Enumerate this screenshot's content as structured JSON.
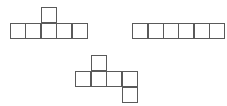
{
  "diagram": {
    "type": "cube-nets",
    "cell_size": 16,
    "line_color": "#5a5a5a",
    "background": "#ffffff",
    "nets": [
      {
        "id": "net-1",
        "description": "Row of five squares with one square above the third",
        "cells": [
          {
            "x": 41,
            "y": 7
          },
          {
            "x": 10,
            "y": 23
          },
          {
            "x": 25,
            "y": 23
          },
          {
            "x": 41,
            "y": 23
          },
          {
            "x": 56,
            "y": 23
          },
          {
            "x": 72,
            "y": 23
          }
        ]
      },
      {
        "id": "net-2",
        "description": "Row of six squares",
        "cells": [
          {
            "x": 132,
            "y": 23
          },
          {
            "x": 148,
            "y": 23
          },
          {
            "x": 163,
            "y": 23
          },
          {
            "x": 178,
            "y": 23
          },
          {
            "x": 194,
            "y": 23
          },
          {
            "x": 209,
            "y": 23
          }
        ]
      },
      {
        "id": "net-3",
        "description": "Row of four squares with one above the second and one below the fourth",
        "cells": [
          {
            "x": 91,
            "y": 55
          },
          {
            "x": 75,
            "y": 71
          },
          {
            "x": 91,
            "y": 71
          },
          {
            "x": 106,
            "y": 71
          },
          {
            "x": 122,
            "y": 71
          },
          {
            "x": 122,
            "y": 87
          }
        ]
      }
    ]
  }
}
